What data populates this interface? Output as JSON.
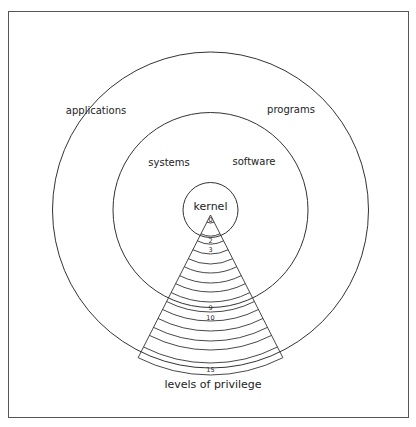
{
  "labels": {
    "applications": "applications",
    "programs": "programs",
    "systems": "systems",
    "software": "software",
    "kernel": "kernel",
    "levels": "levels of privilege"
  },
  "levels": {
    "count": 16,
    "shown_labels": [
      {
        "level": 0,
        "text": "0"
      },
      {
        "level": 2,
        "text": "2"
      },
      {
        "level": 3,
        "text": "3"
      },
      {
        "level": 9,
        "text": "9"
      },
      {
        "level": 10,
        "text": "10"
      },
      {
        "level": 15,
        "text": "15"
      }
    ]
  },
  "colors": {
    "line": "#333333",
    "text": "#222222"
  }
}
